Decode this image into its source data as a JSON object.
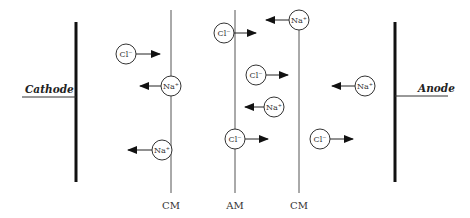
{
  "electrodes": {
    "cathode": {
      "label": "Cathode",
      "x": 76
    },
    "anode": {
      "label": "Anode",
      "x": 395
    }
  },
  "membranes": [
    {
      "label": "CM",
      "x": 171
    },
    {
      "label": "AM",
      "x": 235
    },
    {
      "label": "CM",
      "x": 299
    }
  ],
  "ions": [
    {
      "label": "Cl⁻",
      "cx": 126,
      "cy": 54,
      "dir": "right"
    },
    {
      "label": "Na⁺",
      "cx": 171,
      "cy": 86,
      "dir": "left"
    },
    {
      "label": "Na⁺",
      "cx": 162,
      "cy": 150,
      "dir": "left"
    },
    {
      "label": "Cl⁻",
      "cx": 224,
      "cy": 33,
      "dir": "right"
    },
    {
      "label": "Na⁺",
      "cx": 299,
      "cy": 20,
      "dir": "left"
    },
    {
      "label": "Cl⁻",
      "cx": 256,
      "cy": 75,
      "dir": "right"
    },
    {
      "label": "Na⁺",
      "cx": 274,
      "cy": 107,
      "dir": "left"
    },
    {
      "label": "Cl⁻",
      "cx": 235,
      "cy": 139,
      "dir": "right"
    },
    {
      "label": "Na⁺",
      "cx": 365,
      "cy": 86,
      "dir": "left"
    },
    {
      "label": "Cl⁻",
      "cx": 320,
      "cy": 139,
      "dir": "right"
    }
  ],
  "colors": {
    "stroke": "#222222",
    "membrane": "#555555"
  }
}
